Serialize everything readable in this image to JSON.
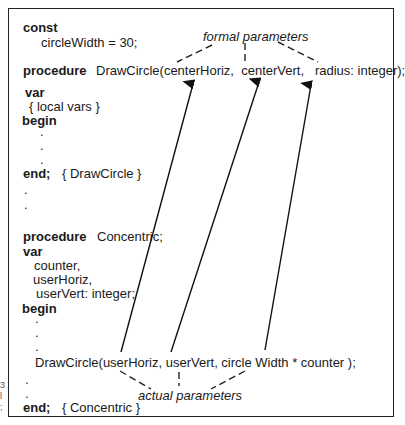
{
  "code": {
    "const_kw": "const",
    "const_decl": "circleWidth = 30;",
    "proc1_kw": "procedure",
    "proc1_sig": "DrawCircle(centerHoriz,  centerVert,   radius: integer);",
    "var1_kw": "var",
    "local_vars": "{ local vars }",
    "begin1_kw": "begin",
    "end1_kw": "end;",
    "end1_comment": "{ DrawCircle }",
    "proc2_kw": "procedure",
    "proc2_name": "Concentric;",
    "var2_kw": "var",
    "var2_lines": [
      "counter,",
      "userHoriz,",
      "userVert: integer;"
    ],
    "begin2_kw": "begin",
    "call": "DrawCircle(userHoriz, userVert, circle Width * counter );",
    "end2_kw": "end;",
    "end2_comment": "{ Concentric }",
    "ellipsis": "."
  },
  "labels": {
    "formal": "formal parameters",
    "actual": "actual parameters"
  },
  "margin_marks": [
    "3",
    "l",
    ";"
  ],
  "colors": {
    "ink": "#1a1a1a",
    "frame": "#222222",
    "background": "#ffffff"
  }
}
